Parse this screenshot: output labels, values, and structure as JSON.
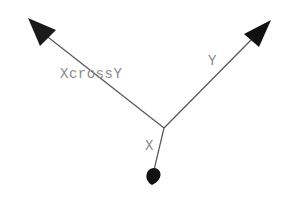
{
  "diagram": {
    "type": "vector-cross-product",
    "origin": {
      "x": 164,
      "y": 128
    },
    "vectors": [
      {
        "name": "XcrossY",
        "label": "XcrossY",
        "tip": {
          "x": 28,
          "y": 18
        },
        "head": "cone"
      },
      {
        "name": "Y",
        "label": "Y",
        "tip": {
          "x": 271,
          "y": 20
        },
        "head": "cone"
      },
      {
        "name": "X",
        "label": "X",
        "tip": {
          "x": 152,
          "y": 183
        },
        "head": "cone-foreshortened"
      }
    ],
    "colors": {
      "line": "#555555",
      "arrowhead": "#111111",
      "label": "#8a8a8a",
      "background": "#ffffff"
    }
  },
  "labels": {
    "xcrossy": "XcrossY",
    "y": "Y",
    "x": "X"
  }
}
